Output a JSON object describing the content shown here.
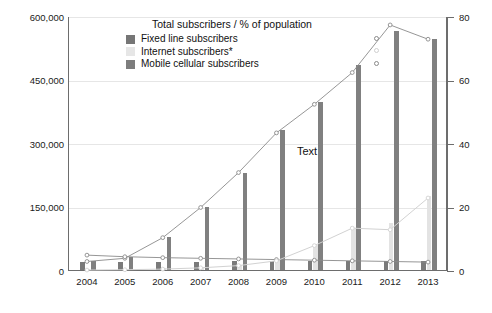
{
  "chart_data": {
    "type": "bar",
    "title": "Total subscribers / % of population",
    "xlabel": "",
    "ylabel": "",
    "grid": true,
    "legend_position": "top-center",
    "categories": [
      "2004",
      "2005",
      "2006",
      "2007",
      "2008",
      "2009",
      "2010",
      "2011",
      "2012",
      "2013"
    ],
    "ylim": [
      0,
      600000
    ],
    "yticks": [
      "0",
      "150,000",
      "300,000",
      "450,000",
      "600,000"
    ],
    "ytick_values": [
      0,
      150000,
      300000,
      450000,
      600000
    ],
    "y2lim": [
      0,
      80
    ],
    "y2ticks": [
      "0",
      "20",
      "40",
      "60",
      "80"
    ],
    "y2tick_values": [
      0,
      20,
      40,
      60,
      80
    ],
    "series": [
      {
        "name": "Fixed line subscribers",
        "type": "bar",
        "axis": "left",
        "color": "#7a7a7a",
        "values": [
          18000,
          19000,
          19500,
          20000,
          20500,
          21000,
          21500,
          22000,
          22000,
          21500
        ]
      },
      {
        "name": "Internet subscribers*",
        "type": "bar",
        "axis": "left",
        "color": "#e3e3e3",
        "values": [
          1500,
          2500,
          4000,
          7000,
          12000,
          24000,
          60000,
          100000,
          110000,
          175000
        ]
      },
      {
        "name": "Mobile cellular subscribers",
        "type": "bar",
        "axis": "left",
        "color": "#808080",
        "values": [
          22000,
          30000,
          78000,
          148000,
          228000,
          330000,
          398000,
          485000,
          565000,
          545000
        ]
      },
      {
        "name": "Mobile cellular % of population",
        "type": "line",
        "axis": "right",
        "color": "#8a8a8a",
        "marker": "open-circle",
        "values": [
          3.0,
          4.0,
          10.5,
          20.0,
          31.0,
          43.5,
          52.5,
          62.5,
          77.5,
          73.0
        ]
      },
      {
        "name": "Fixed line % of population",
        "type": "line",
        "axis": "right",
        "color": "#8a8a8a",
        "marker": "open-circle",
        "values": [
          5.0,
          4.5,
          4.2,
          4.0,
          3.8,
          3.6,
          3.4,
          3.2,
          3.0,
          2.8
        ]
      },
      {
        "name": "Internet % of population",
        "type": "line",
        "axis": "right",
        "color": "#d2d2d2",
        "marker": "open-circle",
        "values": [
          0.3,
          0.4,
          0.6,
          1.0,
          1.7,
          3.2,
          8.0,
          13.5,
          13.0,
          23.0
        ]
      }
    ],
    "annotations": [
      {
        "text": "Text",
        "x": "2009",
        "y": 300000
      }
    ]
  },
  "legend": {
    "title": "Total subscribers / % of population",
    "entries": [
      {
        "label": "Fixed line subscribers",
        "swatch": "fixed",
        "marker": "open-circle"
      },
      {
        "label": "Internet subscribers*",
        "swatch": "internet",
        "marker": "open-circle-faint"
      },
      {
        "label": "Mobile cellular subscribers",
        "swatch": "mobile",
        "marker": "open-circle"
      }
    ]
  },
  "axes": {
    "left_labels": [
      "600,000",
      "450,000",
      "300,000",
      "150,000",
      "0"
    ],
    "right_labels": [
      "80",
      "60",
      "40",
      "20",
      "0"
    ],
    "x_labels": [
      "2004",
      "2005",
      "2006",
      "2007",
      "2008",
      "2009",
      "2010",
      "2011",
      "2012",
      "2013"
    ]
  },
  "annotation_text": "Text",
  "colors": {
    "fixed": "#7a7a7a",
    "internet": "#e3e3e3",
    "mobile": "#808080",
    "axis": "#6d6d6d",
    "grid": "#e6e6e6",
    "line_dark": "#8a8a8a",
    "line_light": "#d2d2d2"
  }
}
